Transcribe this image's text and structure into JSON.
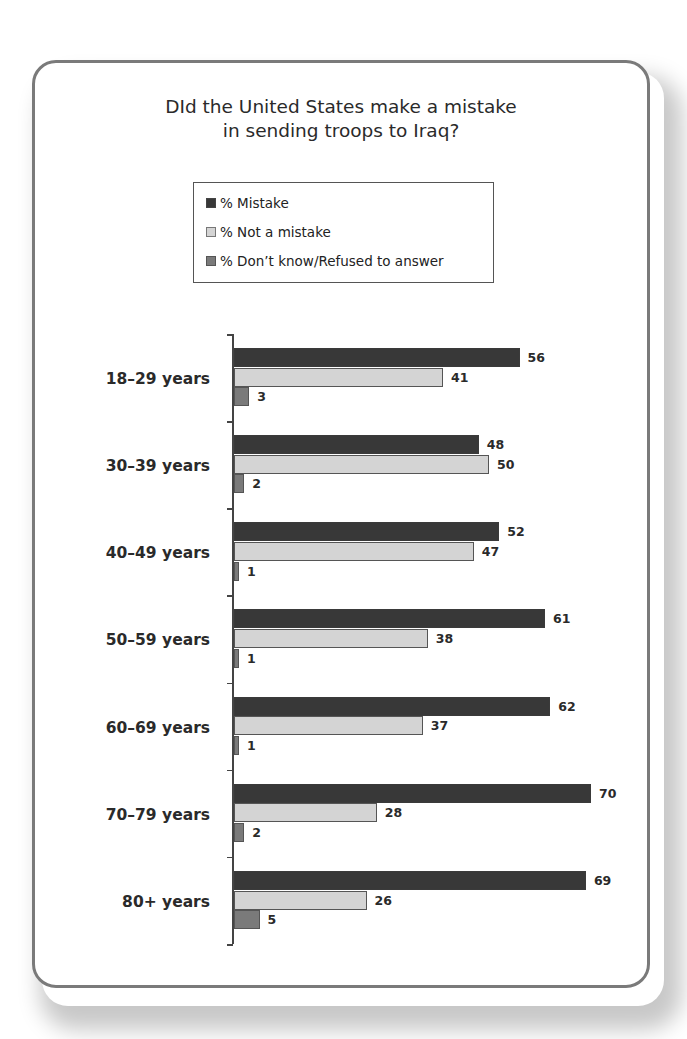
{
  "title_line1": "DId the United States make a mistake",
  "title_line2": "in sending troops to Iraq?",
  "legend": [
    {
      "label": "% Mistake",
      "color": "#383838"
    },
    {
      "label": "% Not a mistake",
      "color": "#d4d4d4"
    },
    {
      "label": "% Don’t know/Refused to answer",
      "color": "#7a7a7a"
    }
  ],
  "categories": [
    "18–29 years",
    "30–39 years",
    "40–49 years",
    "50–59 years",
    "60–69 years",
    "70–79 years",
    "80+ years"
  ],
  "chart_data": {
    "type": "bar",
    "orientation": "horizontal",
    "title": "DId the United States make a mistake in sending troops to Iraq?",
    "categories": [
      "18–29 years",
      "30–39 years",
      "40–49 years",
      "50–59 years",
      "60–69 years",
      "70–79 years",
      "80+ years"
    ],
    "series": [
      {
        "name": "% Mistake",
        "values": [
          56,
          48,
          52,
          61,
          62,
          70,
          69
        ],
        "color": "#383838"
      },
      {
        "name": "% Not a mistake",
        "values": [
          41,
          50,
          47,
          38,
          37,
          28,
          26
        ],
        "color": "#d4d4d4"
      },
      {
        "name": "% Don’t know/Refused to answer",
        "values": [
          3,
          2,
          1,
          1,
          1,
          2,
          5
        ],
        "color": "#7a7a7a"
      }
    ],
    "xlabel": "",
    "ylabel": "",
    "data_labels": true,
    "grid": false,
    "legend_position": "top"
  }
}
